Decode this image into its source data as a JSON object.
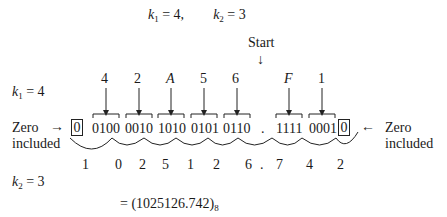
{
  "header": {
    "k1_label": "k",
    "k1_sub": "1",
    "k1_eq": " = 4,",
    "k2_label": "k",
    "k2_sub": "2",
    "k2_eq": " = 3"
  },
  "start_label": "Start",
  "start_arrow": "↓",
  "k1_row": {
    "label": "k",
    "sub": "1",
    "eq": " = 4"
  },
  "hex_digits": [
    "4",
    "2",
    "A",
    "5",
    "6",
    "F",
    "1"
  ],
  "binary_groups": [
    "0100",
    "0010",
    "1010",
    "0101",
    "0110",
    "1111",
    "0001"
  ],
  "radix_point": ".",
  "zero_box": "0",
  "left_note": {
    "line1": "Zero",
    "line2": "included",
    "arrow": "→"
  },
  "right_note": {
    "line1": "Zero",
    "line2": "included",
    "arrow": "←"
  },
  "octal_digits": [
    "1",
    "0",
    "2",
    "5",
    "1",
    "2",
    "6",
    ".",
    "7",
    "4",
    "2"
  ],
  "k2_row": {
    "label": "k",
    "sub": "2",
    "eq": " = 3"
  },
  "result": {
    "prefix": "= (1025126.742)",
    "base": "8"
  }
}
